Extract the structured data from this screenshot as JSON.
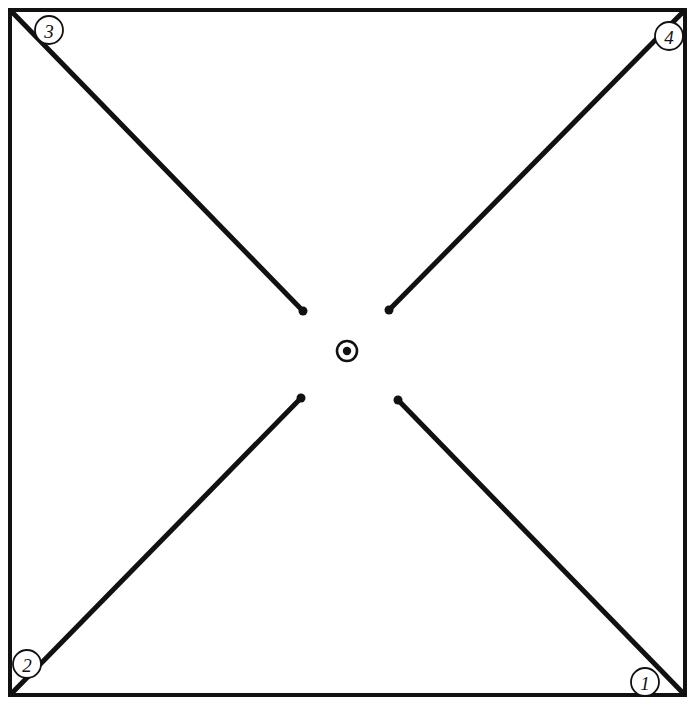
{
  "diagram": {
    "background_color": "#ffffff",
    "ink_color": "#111111",
    "canvas": {
      "width": 695,
      "height": 708
    },
    "frame": {
      "name": "outer-square-border",
      "left": 10,
      "top": 10,
      "right": 685,
      "bottom": 695,
      "stroke_width": 4
    },
    "center_mark": {
      "name": "center-target-mark",
      "cx": 347,
      "cy": 351,
      "ring_radius": 10,
      "dot_radius": 4.2
    },
    "radial_lines": [
      {
        "id": "line-to-corner-3",
        "corner_label": "3",
        "x1": 13,
        "y1": 13,
        "x2": 303,
        "y2": 311,
        "endpoint_dot_radius": 4.5
      },
      {
        "id": "line-to-corner-4",
        "corner_label": "4",
        "x1": 682,
        "y1": 13,
        "x2": 389,
        "y2": 310,
        "endpoint_dot_radius": 4.5
      },
      {
        "id": "line-to-corner-2",
        "corner_label": "2",
        "x1": 13,
        "y1": 692,
        "x2": 301,
        "y2": 398,
        "endpoint_dot_radius": 4.5
      },
      {
        "id": "line-to-corner-1",
        "corner_label": "1",
        "x1": 682,
        "y1": 692,
        "x2": 398,
        "y2": 400,
        "endpoint_dot_radius": 4.5
      }
    ],
    "reference_labels": [
      {
        "id": "ref-3",
        "text": "3",
        "cx": 49,
        "cy": 30,
        "radius": 14
      },
      {
        "id": "ref-4",
        "text": "4",
        "cx": 669,
        "cy": 36,
        "radius": 14
      },
      {
        "id": "ref-2",
        "text": "2",
        "cx": 27,
        "cy": 664,
        "radius": 14
      },
      {
        "id": "ref-1",
        "text": "1",
        "cx": 645,
        "cy": 682,
        "radius": 14
      }
    ]
  }
}
